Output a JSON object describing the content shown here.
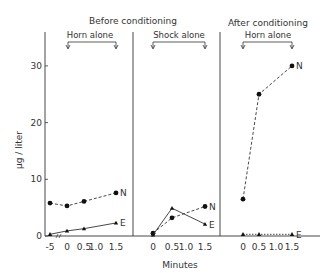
{
  "chart_data": {
    "type": "line",
    "title": "",
    "xlabel": "Minutes",
    "ylabel": "µg / liter",
    "ylim": [
      0,
      35
    ],
    "yticks": [
      0,
      10,
      20,
      30
    ],
    "grid": false,
    "headers": {
      "before": "Before conditioning",
      "after": "After conditioning"
    },
    "panels": [
      {
        "label": "Horn alone",
        "group": "Before conditioning",
        "x_ticks": [
          "-5",
          "0",
          "0.5",
          "1.0",
          "1.5"
        ],
        "x": [
          -5,
          0,
          0.5,
          1.5
        ],
        "series": [
          {
            "name": "N",
            "style": "dashed",
            "marker": "circle",
            "values": [
              5.8,
              5.3,
              6.1,
              7.6
            ]
          },
          {
            "name": "E",
            "style": "solid",
            "marker": "triangle",
            "values": [
              0.3,
              0.9,
              1.3,
              2.3
            ]
          }
        ]
      },
      {
        "label": "Shock alone",
        "group": "Before conditioning",
        "x_ticks": [
          "0",
          "0.5",
          "1.0",
          "1.5"
        ],
        "x": [
          0,
          0.5,
          1.5
        ],
        "series": [
          {
            "name": "N",
            "style": "dashed",
            "marker": "circle",
            "values": [
              0.5,
              3.2,
              5.2
            ]
          },
          {
            "name": "E",
            "style": "solid",
            "marker": "triangle",
            "values": [
              0.2,
              4.9,
              2.1
            ]
          }
        ]
      },
      {
        "label": "Horn alone",
        "group": "After conditioning",
        "x_ticks": [
          "0",
          "0.5",
          "1.0",
          "1.5"
        ],
        "x": [
          0,
          0.5,
          1.5
        ],
        "series": [
          {
            "name": "N",
            "style": "dashed",
            "marker": "circle",
            "values": [
              6.5,
              25,
              30
            ]
          },
          {
            "name": "E",
            "style": "dotted",
            "marker": "triangle",
            "values": [
              0.3,
              0.3,
              0.3
            ]
          }
        ]
      }
    ]
  }
}
